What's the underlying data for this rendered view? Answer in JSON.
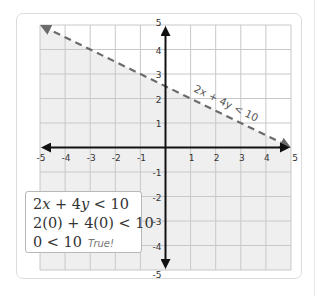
{
  "chart_data": {
    "type": "line",
    "title": "",
    "xlabel": "",
    "ylabel": "",
    "xlim": [
      -5,
      5
    ],
    "ylim": [
      -5,
      5
    ],
    "grid": true,
    "x_ticks": [
      -5,
      -4,
      -3,
      -2,
      -1,
      1,
      2,
      3,
      4,
      5
    ],
    "y_ticks": [
      5,
      4,
      3,
      2,
      1,
      -1,
      -2,
      -3,
      -4,
      -5
    ],
    "x_tick_labels": [
      "-5",
      "-4",
      "-3",
      "-2",
      "-1",
      "1",
      "2",
      "3",
      "4",
      "5"
    ],
    "y_tick_labels": [
      "5",
      "4",
      "3",
      "2",
      "1",
      "-1",
      "-2",
      "-3",
      "-4",
      "-5"
    ],
    "boundary_line": {
      "equation": "2x + 4y = 10",
      "label": "2x + 4y < 10",
      "style": "dashed",
      "points": [
        [
          -5,
          5
        ],
        [
          5,
          0
        ]
      ],
      "color": "#6b6b6b"
    },
    "shaded_region": {
      "inequality": "2x + 4y < 10",
      "side": "below",
      "color": "#efefef"
    },
    "annotations": [
      "2x + 4y < 10",
      "2(0) + 4(0) < 10",
      "0 < 10",
      "True!"
    ]
  },
  "test_box": {
    "line1": {
      "a": "2",
      "x": "x",
      "mid": " + 4",
      "y": "y",
      "rest": " < 10"
    },
    "line2": "2(0) + 4(0) < 10",
    "line3": "0 < 10",
    "verdict": "True!"
  },
  "colors": {
    "axis": "#111111",
    "grid": "#c8c8c8",
    "shade": "#efefef",
    "dashed_line": "#6b6b6b"
  }
}
